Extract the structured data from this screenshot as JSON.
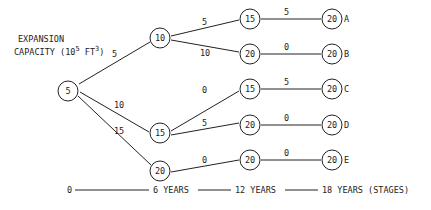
{
  "title": {
    "line1": "EXPANSION",
    "line2_prefix": "CAPACITY (10",
    "line2_exp1": "5",
    "line2_mid": " FT",
    "line2_exp2": "3",
    "line2_suffix": ")"
  },
  "nodes": {
    "root": {
      "value": "5"
    },
    "s1_top": {
      "value": "10"
    },
    "s1_mid": {
      "value": "15"
    },
    "s1_bot": {
      "value": "20"
    },
    "s2_a": {
      "value": "15"
    },
    "s2_b": {
      "value": "20"
    },
    "s2_c": {
      "value": "15"
    },
    "s2_d": {
      "value": "20"
    },
    "s2_e": {
      "value": "20"
    },
    "s3_a": {
      "value": "20",
      "label": "A"
    },
    "s3_b": {
      "value": "20",
      "label": "B"
    },
    "s3_c": {
      "value": "20",
      "label": "C"
    },
    "s3_d": {
      "value": "20",
      "label": "D"
    },
    "s3_e": {
      "value": "20",
      "label": "E"
    }
  },
  "edges": {
    "root_top": "5",
    "root_mid": "10",
    "root_bot": "15",
    "top_a": "5",
    "top_b": "10",
    "mid_c": "0",
    "mid_d": "5",
    "bot_e": "0",
    "a_final": "5",
    "b_final": "0",
    "c_final": "5",
    "d_final": "0",
    "e_final": "0"
  },
  "timeline": {
    "t0": "0",
    "t1": "6 YEARS",
    "t2": "12 YEARS",
    "t3": "18 YEARS (STAGES)"
  }
}
